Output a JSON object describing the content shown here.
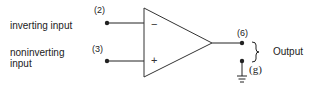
{
  "diagram": {
    "inputs": {
      "inverting": {
        "label": "inverting input",
        "pin": "(2)",
        "sign": "−"
      },
      "noninverting": {
        "label_line1": "noninverting",
        "label_line2": "input",
        "pin": "(3)",
        "sign": "+"
      }
    },
    "output": {
      "label": "Output",
      "pin": "(6)",
      "ground_pin": "(g)"
    },
    "colors": {
      "stroke": "#222222",
      "background": "#ffffff"
    }
  }
}
